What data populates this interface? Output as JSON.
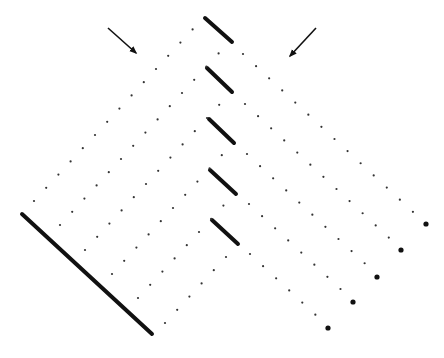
{
  "figure": {
    "width": 444,
    "height": 358,
    "background": "#ffffff",
    "ink": "#111111"
  },
  "arrows": [
    {
      "name": "left-arrow",
      "from": [
        108,
        28
      ],
      "to": [
        136,
        53
      ]
    },
    {
      "name": "right-arrow",
      "from": [
        316,
        28
      ],
      "to": [
        290,
        56
      ]
    }
  ],
  "long_line": {
    "from": [
      22,
      214
    ],
    "to": [
      152,
      334
    ],
    "width": 4
  },
  "short_segments": [
    {
      "from": [
        205,
        18
      ],
      "to": [
        232,
        42
      ]
    },
    {
      "from": [
        207,
        68
      ],
      "to": [
        232,
        92
      ]
    },
    {
      "from": [
        209,
        119
      ],
      "to": [
        234,
        143
      ]
    },
    {
      "from": [
        210,
        170
      ],
      "to": [
        236,
        194
      ]
    },
    {
      "from": [
        212,
        220
      ],
      "to": [
        238,
        244
      ]
    }
  ],
  "left_lattice": {
    "step": [
      12.2,
      -13.2
    ],
    "rows": [
      {
        "start": [
          34,
          201
        ],
        "count": 14
      },
      {
        "start": [
          60,
          225
        ],
        "count": 14
      },
      {
        "start": [
          85,
          250
        ],
        "count": 12
      },
      {
        "start": [
          112,
          274
        ],
        "count": 10
      },
      {
        "start": [
          138,
          298
        ],
        "count": 8
      },
      {
        "start": [
          165,
          323
        ],
        "count": 6
      }
    ]
  },
  "right_lattice": {
    "step": [
      13.07,
      12.14
    ],
    "rows": [
      {
        "start": [
          243,
          54
        ],
        "count": 14,
        "end_marker": [
          426,
          224
        ]
      },
      {
        "start": [
          245,
          104
        ],
        "count": 12,
        "end_marker": [
          401,
          250
        ]
      },
      {
        "start": [
          247,
          154
        ],
        "count": 10,
        "end_marker": [
          377,
          277
        ]
      },
      {
        "start": [
          249,
          204
        ],
        "count": 8,
        "end_marker": [
          353,
          302
        ]
      },
      {
        "start": [
          250,
          254
        ],
        "count": 6,
        "end_marker": [
          328,
          328
        ]
      }
    ]
  },
  "dot_radius": 1.1,
  "end_marker_radius": 2.6
}
